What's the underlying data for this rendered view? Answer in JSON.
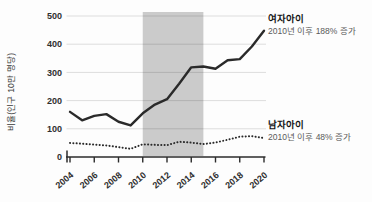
{
  "figure": {
    "background": "#fdfdfd",
    "band_color": "#cbcbcb",
    "line_color": "#2a2a2a",
    "grid_color": "rgba(0,0,0,0.13)",
    "axis_color": "#2b2b2b",
    "tick_label_color": "#303030"
  },
  "chart_data": {
    "type": "line",
    "title": "",
    "xlabel": "",
    "ylabel": "비율(인구 10만 명당)",
    "ylim": [
      0,
      500
    ],
    "yticks": [
      0,
      100,
      200,
      300,
      400,
      500
    ],
    "grid": "horizontal",
    "legend_position": "right-annotations",
    "x": [
      2004,
      2005,
      2006,
      2007,
      2008,
      2009,
      2010,
      2011,
      2012,
      2013,
      2014,
      2015,
      2016,
      2017,
      2018,
      2019,
      2020
    ],
    "xticklabels": [
      "2004",
      "2006",
      "2008",
      "2010",
      "2012",
      "2014",
      "2016",
      "2018",
      "2020"
    ],
    "highlight_band": {
      "x_start": 2010,
      "x_end": 2015
    },
    "series": [
      {
        "name": "여자아이",
        "style": "solid",
        "annotation": "2010년 이후 188% 증가",
        "values": [
          160,
          130,
          146,
          152,
          125,
          112,
          155,
          186,
          205,
          260,
          318,
          321,
          313,
          343,
          347,
          392,
          448
        ]
      },
      {
        "name": "남자아이",
        "style": "dotted",
        "annotation": "2010년 이후 48% 증가",
        "values": [
          50,
          47,
          44,
          41,
          35,
          29,
          45,
          43,
          42,
          54,
          51,
          46,
          51,
          61,
          72,
          74,
          67
        ]
      }
    ]
  }
}
